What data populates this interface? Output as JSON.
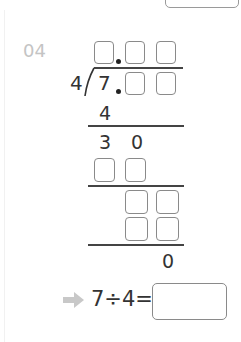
{
  "problem": {
    "number": "04",
    "divisor": "4",
    "dividend_whole": "7",
    "first_product": "4",
    "remainder_row": [
      "3",
      "0"
    ],
    "final_remainder": "0",
    "equation": "7÷4=",
    "answer_value": ""
  },
  "colors": {
    "number_label": "#c4c4c4",
    "box_border": "#8a8a8a",
    "arrow": "#c8c8c8",
    "text": "#333333"
  },
  "icons": {
    "arrow": "right-arrow-icon"
  }
}
